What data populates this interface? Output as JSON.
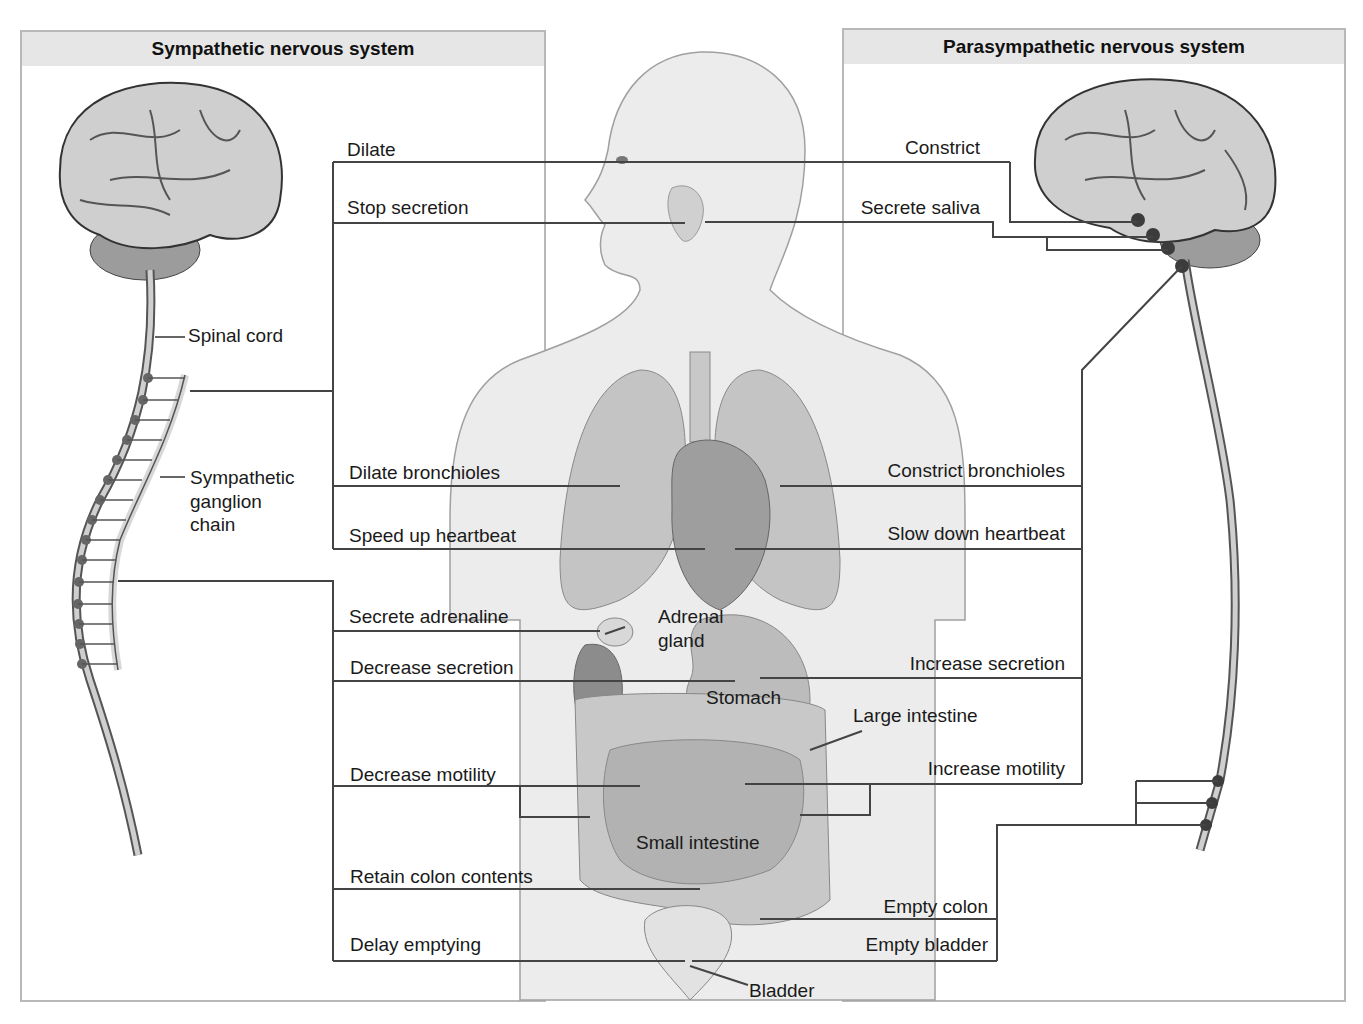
{
  "panels": {
    "sympathetic": {
      "title": "Sympathetic nervous system"
    },
    "parasympathetic": {
      "title": "Parasympathetic nervous system"
    }
  },
  "anatomy_labels": {
    "spinal_cord": "Spinal cord",
    "ganglion_chain": [
      "Sympathetic",
      "ganglion",
      "chain"
    ],
    "adrenal_gland": [
      "Adrenal",
      "gland"
    ],
    "stomach": "Stomach",
    "large_intestine": "Large intestine",
    "small_intestine": "Small intestine",
    "bladder": "Bladder"
  },
  "sympathetic_effects": [
    {
      "organ": "eye",
      "label": "Dilate"
    },
    {
      "organ": "salivary-gland",
      "label": "Stop secretion"
    },
    {
      "organ": "lungs",
      "label": "Dilate bronchioles"
    },
    {
      "organ": "heart",
      "label": "Speed up heartbeat"
    },
    {
      "organ": "adrenal-gland",
      "label": "Secrete adrenaline"
    },
    {
      "organ": "stomach",
      "label": "Decrease secretion"
    },
    {
      "organ": "intestine",
      "label": "Decrease motility"
    },
    {
      "organ": "colon",
      "label": "Retain colon contents"
    },
    {
      "organ": "bladder",
      "label": "Delay emptying"
    }
  ],
  "parasympathetic_effects": [
    {
      "organ": "eye",
      "label": "Constrict"
    },
    {
      "organ": "salivary-gland",
      "label": "Secrete saliva"
    },
    {
      "organ": "lungs",
      "label": "Constrict bronchioles"
    },
    {
      "organ": "heart",
      "label": "Slow down heartbeat"
    },
    {
      "organ": "stomach",
      "label": "Increase secretion"
    },
    {
      "organ": "intestine",
      "label": "Increase motility"
    },
    {
      "organ": "colon",
      "label": "Empty colon"
    },
    {
      "organ": "bladder",
      "label": "Empty bladder"
    }
  ],
  "colors": {
    "line": "#444444",
    "panel_border": "#b8b8b8",
    "header_bg": "#e6e6e6",
    "body_fill": "#ececec",
    "organ_fill": "#bdbdbd",
    "ganglion_dot": "#555555"
  }
}
